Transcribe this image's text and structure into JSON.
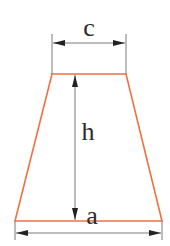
{
  "diagram": {
    "type": "trapezoid-dimensions",
    "colors": {
      "shape": "#f07040",
      "dimension": "#7a7a7a",
      "arrow": "#222222",
      "text": "#2b2b2b"
    },
    "labels": {
      "top_base": "c",
      "height": "h",
      "bottom_base": "a"
    }
  }
}
